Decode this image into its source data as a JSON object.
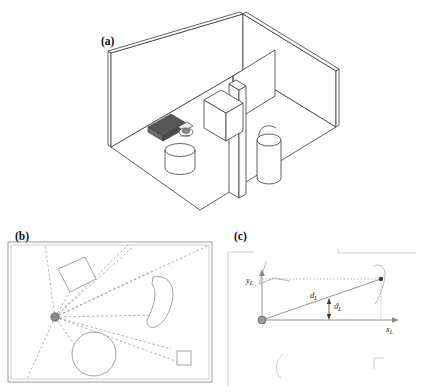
{
  "figure": {
    "panels": [
      {
        "id": "a",
        "label": "(a)",
        "caption_text": "(a)",
        "description": "isometric 3d room with robot and obstacles"
      },
      {
        "id": "b",
        "label": "(b)",
        "caption_text": "(b)",
        "description": "top down laser scan ray casting map"
      },
      {
        "id": "c",
        "label": "(c)",
        "caption_text": "(c)",
        "description": "laser frame polar coordinate geometry"
      }
    ]
  },
  "panel_a": {
    "label": "(a)",
    "objects": [
      {
        "name": "robot",
        "fill": "#555555"
      },
      {
        "name": "cylinder-small",
        "fill": "#ffffff"
      },
      {
        "name": "box",
        "fill": "#ffffff"
      },
      {
        "name": "pillar",
        "fill": "#ffffff"
      },
      {
        "name": "partition-wall",
        "fill": "#ffffff"
      },
      {
        "name": "cylinder-large",
        "fill": "#ffffff"
      }
    ],
    "colors": {
      "outline": "#3a3a3a",
      "wall": "#ffffff",
      "robot_body": "#575757",
      "floor": "#ffffff"
    }
  },
  "panel_b": {
    "label": "(b)",
    "colors": {
      "border": "#9a9a9a",
      "ray": "#8c8c8c",
      "obstacle": "#8c8c8c",
      "sensor_dot": "#8a8a8a"
    },
    "sensor_origin": {
      "x": 55,
      "y": 317
    },
    "beam_count": 11
  },
  "panel_c": {
    "label": "(c)",
    "axis_labels": {
      "x": "x",
      "x_sub": "L",
      "y": "y",
      "y_sub": "L"
    },
    "measurements": [
      {
        "symbol": "d",
        "subscript": "L",
        "meaning": "range"
      },
      {
        "symbol": "ϑ",
        "subscript": "L",
        "meaning": "bearing angle"
      }
    ],
    "colors": {
      "axis": "#8a8a8a",
      "ray": "#8a8a8a",
      "dotted": "#9a9a9a",
      "faint": "#bdbdbd",
      "origin_dot": "#8a8a8a"
    }
  }
}
